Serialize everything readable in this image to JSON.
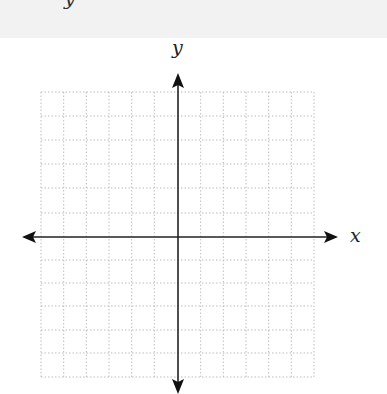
{
  "diagram": {
    "type": "coordinate-plane",
    "top_band_partial_text": "y",
    "axes": {
      "x_label": "x",
      "y_label": "y"
    },
    "grid": {
      "columns": 12,
      "rows": 12,
      "style": "dotted"
    },
    "colors": {
      "axis": "#222222",
      "grid": "#bdbdbd",
      "top_band": "#f2f2f2"
    }
  }
}
